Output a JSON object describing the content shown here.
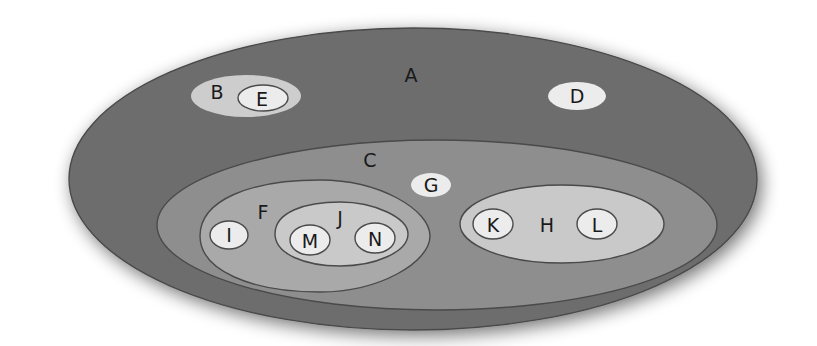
{
  "diagram": {
    "type": "nested-set-venn",
    "colors": {
      "background": "#ffffff",
      "level1": "#6d6d6d",
      "level2": "#8e8e8e",
      "level3": "#a9a9a9",
      "level4": "#c9c9c9",
      "leaf": "#ececec",
      "outline": "#4a4a4a",
      "text": "#1a1a1a"
    },
    "sets": [
      {
        "id": "A",
        "label": "A",
        "parent": null,
        "children": [
          "B",
          "C",
          "D"
        ]
      },
      {
        "id": "B",
        "label": "B",
        "parent": "A",
        "children": [
          "E"
        ]
      },
      {
        "id": "E",
        "label": "E",
        "parent": "B",
        "children": []
      },
      {
        "id": "D",
        "label": "D",
        "parent": "A",
        "children": []
      },
      {
        "id": "C",
        "label": "C",
        "parent": "A",
        "children": [
          "F",
          "G",
          "H"
        ]
      },
      {
        "id": "G",
        "label": "G",
        "parent": "C",
        "children": []
      },
      {
        "id": "F",
        "label": "F",
        "parent": "C",
        "children": [
          "I",
          "J"
        ]
      },
      {
        "id": "I",
        "label": "I",
        "parent": "F",
        "children": []
      },
      {
        "id": "J",
        "label": "J",
        "parent": "F",
        "children": [
          "M",
          "N"
        ]
      },
      {
        "id": "M",
        "label": "M",
        "parent": "J",
        "children": []
      },
      {
        "id": "N",
        "label": "N",
        "parent": "J",
        "children": []
      },
      {
        "id": "H",
        "label": "H",
        "parent": "C",
        "children": [
          "K",
          "L"
        ]
      },
      {
        "id": "K",
        "label": "K",
        "parent": "H",
        "children": []
      },
      {
        "id": "L",
        "label": "L",
        "parent": "H",
        "children": []
      }
    ],
    "labels": {
      "A": "A",
      "B": "B",
      "C": "C",
      "D": "D",
      "E": "E",
      "F": "F",
      "G": "G",
      "H": "H",
      "I": "I",
      "J": "J",
      "K": "K",
      "L": "L",
      "M": "M",
      "N": "N"
    }
  }
}
